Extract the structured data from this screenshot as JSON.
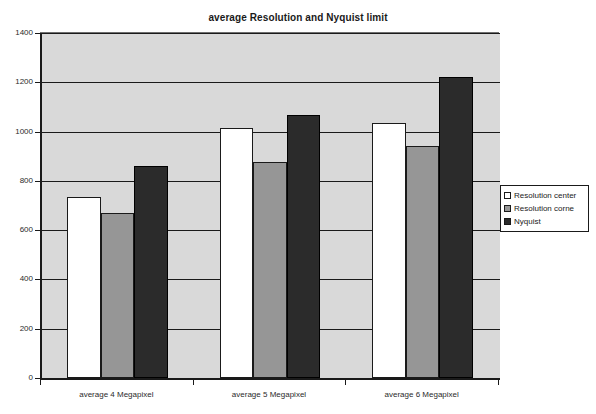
{
  "chart_data": {
    "type": "bar",
    "title": "average Resolution and Nyquist limit",
    "xlabel": "",
    "ylabel": "",
    "categories": [
      "average 4 Megapixel",
      "average 5 Megapixel",
      "average 6 Megapixel"
    ],
    "series": [
      {
        "name": "Resolution center",
        "values": [
          735,
          1013,
          1035
        ],
        "color": "#ffffff"
      },
      {
        "name": "Resolution corne",
        "values": [
          670,
          878,
          940
        ],
        "color": "#969696"
      },
      {
        "name": "Nyquist",
        "values": [
          860,
          1068,
          1222
        ],
        "color": "#2b2b2b"
      }
    ],
    "ylim": [
      0,
      1400
    ],
    "ytick_labels": [
      "1400",
      "1200",
      "1000",
      "800",
      "600",
      "400",
      "200",
      "0"
    ],
    "ytick_values": [
      1400,
      1200,
      1000,
      800,
      600,
      400,
      200,
      0
    ],
    "grid": true,
    "legend_position": "right",
    "plot_background": "#d9d9d9",
    "axis_color": "#1a1a1a"
  },
  "legend": {
    "entries": [
      {
        "label": "Resolution center"
      },
      {
        "label": "Resolution corne"
      },
      {
        "label": "Nyquist"
      }
    ]
  }
}
